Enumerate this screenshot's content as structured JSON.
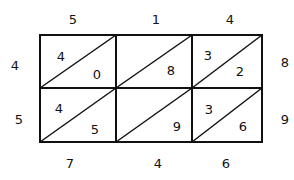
{
  "diagram": {
    "type": "lattice-multiplication",
    "top_digits": [
      "5",
      "1",
      "4"
    ],
    "right_digits": [
      "8",
      "9"
    ],
    "left_digits": [
      "4",
      "5"
    ],
    "bottom_digits": [
      "7",
      "4",
      "6"
    ],
    "cells": [
      [
        {
          "tens": "4",
          "ones": "0"
        },
        {
          "tens": "",
          "ones": "8"
        },
        {
          "tens": "3",
          "ones": "2"
        }
      ],
      [
        {
          "tens": "4",
          "ones": "5"
        },
        {
          "tens": "",
          "ones": "9"
        },
        {
          "tens": "3",
          "ones": "6"
        }
      ]
    ],
    "line_color": "#111111",
    "background": "#ffffff"
  }
}
